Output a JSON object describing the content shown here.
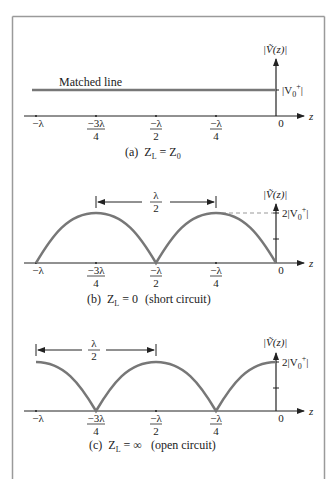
{
  "figure": {
    "frame_color": "#9a9a9a",
    "curve_color": "#777777",
    "axis_color": "#222222",
    "x_ticks": [
      {
        "num": "−λ",
        "den": ""
      },
      {
        "num": "−3λ",
        "den": "4"
      },
      {
        "num": "−λ",
        "den": "2"
      },
      {
        "num": "−λ",
        "den": "4"
      },
      {
        "num": "0",
        "den": ""
      }
    ],
    "x_axis_label": "z",
    "y_axis_label": "|Ṽ(z)|",
    "panels": [
      {
        "id": "a",
        "caption_prefix": "(a)",
        "caption_eq": "Z",
        "caption_sub": "L",
        "caption_rhs": " = Z",
        "caption_rhs_sub": "0",
        "caption_note": "",
        "line_label": "Matched line",
        "level_label": "|V",
        "level_sub": "0",
        "level_sup": "+",
        "level_close": "|"
      },
      {
        "id": "b",
        "caption_prefix": "(b)",
        "caption_eq": "Z",
        "caption_sub": "L",
        "caption_rhs": " = 0",
        "caption_rhs_sub": "",
        "caption_note": "(short circuit)",
        "dimension_num": "λ",
        "dimension_den": "2",
        "level_label": "2|V",
        "level_sub": "0",
        "level_sup": "+",
        "level_close": "|"
      },
      {
        "id": "c",
        "caption_prefix": "(c)",
        "caption_eq": "Z",
        "caption_sub": "L",
        "caption_rhs": " = ∞",
        "caption_rhs_sub": "",
        "caption_note": "(open circuit)",
        "dimension_num": "λ",
        "dimension_den": "2",
        "level_label": "2|V",
        "level_sub": "0",
        "level_sup": "+",
        "level_close": "|"
      }
    ]
  }
}
